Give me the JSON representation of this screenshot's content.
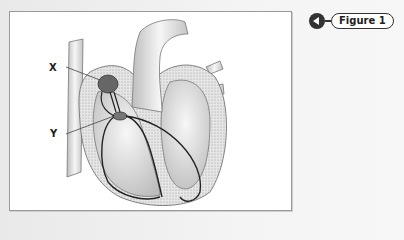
{
  "figure_button": {
    "label": "Figure 1",
    "icon": "back-arrow-icon"
  },
  "diagram": {
    "labels": {
      "x": "X",
      "y": "Y"
    }
  }
}
